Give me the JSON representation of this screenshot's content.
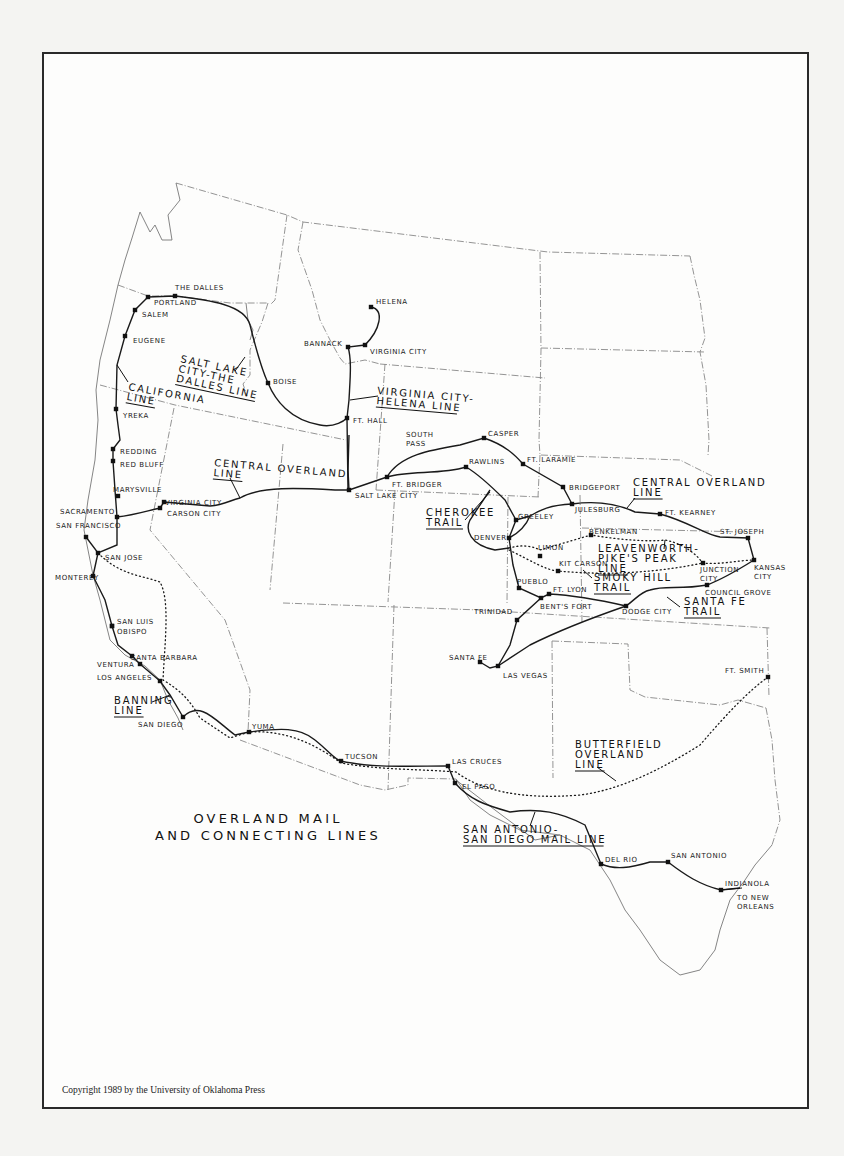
{
  "map": {
    "title_line1": "OVERLAND MAIL",
    "title_line2": "AND CONNECTING LINES",
    "copyright": "Copyright 1989 by the University of Oklahoma Press",
    "colors": {
      "ink": "#1a1a1a",
      "paper": "#fdfdfc",
      "border": "#888888"
    }
  },
  "towns": [
    {
      "name": "THE DALLES",
      "x": 175,
      "y": 296,
      "lx": 175,
      "ly": 290
    },
    {
      "name": "PORTLAND",
      "x": 148,
      "y": 297,
      "lx": 154,
      "ly": 305
    },
    {
      "name": "SALEM",
      "x": 135,
      "y": 310,
      "lx": 142,
      "ly": 317
    },
    {
      "name": "EUGENE",
      "x": 125,
      "y": 336,
      "lx": 133,
      "ly": 343
    },
    {
      "name": "HELENA",
      "x": 371,
      "y": 307,
      "lx": 376,
      "ly": 304
    },
    {
      "name": "BANNACK",
      "x": 348,
      "y": 347,
      "lx": 304,
      "ly": 346
    },
    {
      "name": "VIRGINIA CITY",
      "x": 365,
      "y": 345,
      "lx": 370,
      "ly": 354
    },
    {
      "name": "BOISE",
      "x": 268,
      "y": 383,
      "lx": 273,
      "ly": 384
    },
    {
      "name": "FT. HALL",
      "x": 347,
      "y": 418,
      "lx": 353,
      "ly": 423
    },
    {
      "name": "YREKA",
      "x": 116,
      "y": 409,
      "lx": 123,
      "ly": 418
    },
    {
      "name": "REDDING",
      "x": 113,
      "y": 449,
      "lx": 120,
      "ly": 454
    },
    {
      "name": "RED BLUFF",
      "x": 113,
      "y": 461,
      "lx": 120,
      "ly": 467
    },
    {
      "name": "MARYSVILLE",
      "x": 118,
      "y": 496,
      "lx": 113,
      "ly": 492
    },
    {
      "name": "VIRGINIA CITY",
      "x": 164,
      "y": 502,
      "lx": 165,
      "ly": 505
    },
    {
      "name": "CARSON CITY",
      "x": 160,
      "y": 508,
      "lx": 167,
      "ly": 516
    },
    {
      "name": "SACRAMENTO",
      "x": 117,
      "y": 517,
      "lx": 60,
      "ly": 514
    },
    {
      "name": "SAN FRANCISCO",
      "x": 86,
      "y": 537,
      "lx": 56,
      "ly": 528
    },
    {
      "name": "SAN JOSE",
      "x": 98,
      "y": 553,
      "lx": 105,
      "ly": 560
    },
    {
      "name": "MONTEREY",
      "x": 93,
      "y": 576,
      "lx": 55,
      "ly": 580
    },
    {
      "name": "SAN LUIS",
      "x": 112,
      "y": 626,
      "lx": 117,
      "ly": 624
    },
    {
      "name": "OBISPO",
      "x": 112,
      "y": 626,
      "lx": 117,
      "ly": 634
    },
    {
      "name": "SANTA BARBARA",
      "x": 132,
      "y": 656,
      "lx": 131,
      "ly": 660
    },
    {
      "name": "VENTURA",
      "x": 140,
      "y": 664,
      "lx": 97,
      "ly": 667
    },
    {
      "name": "LOS ANGELES",
      "x": 160,
      "y": 681,
      "lx": 97,
      "ly": 680
    },
    {
      "name": "SAN DIEGO",
      "x": 183,
      "y": 717,
      "lx": 138,
      "ly": 727
    },
    {
      "name": "YUMA",
      "x": 249,
      "y": 732,
      "lx": 252,
      "ly": 729
    },
    {
      "name": "TUCSON",
      "x": 341,
      "y": 761,
      "lx": 345,
      "ly": 759
    },
    {
      "name": "LAS CRUCES",
      "x": 448,
      "y": 766,
      "lx": 452,
      "ly": 764
    },
    {
      "name": "EL PASO",
      "x": 455,
      "y": 783,
      "lx": 462,
      "ly": 789
    },
    {
      "name": "CASPER",
      "x": 484,
      "y": 438,
      "lx": 488,
      "ly": 436
    },
    {
      "name": "SOUTH",
      "x": 0,
      "y": 0,
      "lx": 406,
      "ly": 437
    },
    {
      "name": "PASS",
      "x": 0,
      "y": 0,
      "lx": 406,
      "ly": 446
    },
    {
      "name": "FT. LARAMIE",
      "x": 523,
      "y": 464,
      "lx": 527,
      "ly": 462
    },
    {
      "name": "RAWLINS",
      "x": 466,
      "y": 467,
      "lx": 469,
      "ly": 464
    },
    {
      "name": "FT. BRIDGER",
      "x": 387,
      "y": 477,
      "lx": 392,
      "ly": 487
    },
    {
      "name": "SALT LAKE CITY",
      "x": 349,
      "y": 490,
      "lx": 355,
      "ly": 498
    },
    {
      "name": "BRIDGEPORT",
      "x": 563,
      "y": 487,
      "lx": 569,
      "ly": 490
    },
    {
      "name": "JULESBURG",
      "x": 572,
      "y": 504,
      "lx": 575,
      "ly": 512
    },
    {
      "name": "GREELEY",
      "x": 516,
      "y": 520,
      "lx": 518,
      "ly": 519
    },
    {
      "name": "DENVER",
      "x": 509,
      "y": 538,
      "lx": 474,
      "ly": 540
    },
    {
      "name": "LIMON",
      "x": 540,
      "y": 556,
      "lx": 538,
      "ly": 550
    },
    {
      "name": "BENKELMAN",
      "x": 591,
      "y": 535,
      "lx": 589,
      "ly": 534
    },
    {
      "name": "KIT CARSON",
      "x": 558,
      "y": 571,
      "lx": 559,
      "ly": 566
    },
    {
      "name": "FT. KEARNEY",
      "x": 660,
      "y": 514,
      "lx": 665,
      "ly": 515
    },
    {
      "name": "ST. JOSEPH",
      "x": 748,
      "y": 538,
      "lx": 720,
      "ly": 534
    },
    {
      "name": "KANSAS CITY",
      "x": 754,
      "y": 560,
      "lx": 754,
      "ly": 570
    },
    {
      "name": "KANSAS CITY 2",
      "x": 0,
      "y": 0,
      "lx": 754,
      "ly": 579
    },
    {
      "name": "JUNCTION",
      "x": 703,
      "y": 563,
      "lx": 700,
      "ly": 572
    },
    {
      "name": "JUNCTION 2",
      "x": 0,
      "y": 0,
      "lx": 700,
      "ly": 581
    },
    {
      "name": "COUNCIL GROVE",
      "x": 707,
      "y": 585,
      "lx": 705,
      "ly": 595
    },
    {
      "name": "PUEBLO",
      "x": 519,
      "y": 588,
      "lx": 517,
      "ly": 584
    },
    {
      "name": "FT. LYON",
      "x": 549,
      "y": 594,
      "lx": 553,
      "ly": 592
    },
    {
      "name": "BENT'S FORT",
      "x": 541,
      "y": 598,
      "lx": 540,
      "ly": 609
    },
    {
      "name": "DODGE CITY",
      "x": 626,
      "y": 606,
      "lx": 622,
      "ly": 614
    },
    {
      "name": "TRINIDAD",
      "x": 517,
      "y": 620,
      "lx": 474,
      "ly": 614
    },
    {
      "name": "SANTA FE",
      "x": 480,
      "y": 662,
      "lx": 449,
      "ly": 660
    },
    {
      "name": "LAS VEGAS",
      "x": 498,
      "y": 666,
      "lx": 503,
      "ly": 678
    },
    {
      "name": "FT. SMITH",
      "x": 768,
      "y": 677,
      "lx": 725,
      "ly": 673
    },
    {
      "name": "DEL RIO",
      "x": 601,
      "y": 864,
      "lx": 605,
      "ly": 862
    },
    {
      "name": "SAN ANTONIO",
      "x": 668,
      "y": 862,
      "lx": 671,
      "ly": 858
    },
    {
      "name": "INDIANOLA",
      "x": 721,
      "y": 890,
      "lx": 725,
      "ly": 886
    },
    {
      "name": "TO NEW",
      "x": 0,
      "y": 0,
      "lx": 737,
      "ly": 900
    },
    {
      "name": "ORLEANS",
      "x": 0,
      "y": 0,
      "lx": 737,
      "ly": 909
    }
  ],
  "route_labels": [
    {
      "id": "salt-lake-dalles",
      "lines": [
        "SALT LAKE",
        "CITY-THE",
        "DALLES LINE"
      ],
      "x": 180,
      "y": 362,
      "rotate": 12
    },
    {
      "id": "california",
      "lines": [
        "CALIFORNIA",
        "LINE"
      ],
      "x": 128,
      "y": 390,
      "rotate": 10
    },
    {
      "id": "virginia-helena",
      "lines": [
        "VIRGINIA CITY-",
        "HELENA LINE"
      ],
      "x": 377,
      "y": 394,
      "rotate": 5
    },
    {
      "id": "central-overland-west",
      "lines": [
        "CENTRAL OVERLAND",
        "LINE"
      ],
      "x": 214,
      "y": 466,
      "rotate": 5
    },
    {
      "id": "cherokee",
      "lines": [
        "CHEROKEE",
        "TRAIL"
      ],
      "x": 426,
      "y": 516,
      "rotate": 0
    },
    {
      "id": "central-overland-east",
      "lines": [
        "CENTRAL OVERLAND",
        "LINE"
      ],
      "x": 633,
      "y": 486,
      "rotate": 0
    },
    {
      "id": "leavenworth",
      "lines": [
        "LEAVENWORTH-",
        "PIKE'S PEAK",
        "LINE"
      ],
      "x": 598,
      "y": 552,
      "rotate": 0
    },
    {
      "id": "smoky-hill",
      "lines": [
        "SMOKY HILL",
        "TRAIL"
      ],
      "x": 594,
      "y": 581,
      "rotate": 0
    },
    {
      "id": "santa-fe",
      "lines": [
        "SANTA FE",
        "TRAIL"
      ],
      "x": 684,
      "y": 605,
      "rotate": 0
    },
    {
      "id": "banning",
      "lines": [
        "BANNING",
        "LINE"
      ],
      "x": 114,
      "y": 704,
      "rotate": 0
    },
    {
      "id": "butterfield",
      "lines": [
        "BUTTERFIELD",
        "OVERLAND",
        "LINE"
      ],
      "x": 575,
      "y": 748,
      "rotate": 0
    },
    {
      "id": "san-antonio-san-diego",
      "lines": [
        "SAN ANTONIO-",
        "SAN DIEGO MAIL LINE"
      ],
      "x": 463,
      "y": 833,
      "rotate": 0
    }
  ],
  "legend_icons": {
    "town_marker": "filled-square",
    "solid_route": "stage-line",
    "dotted_route": "alternate-line",
    "state_border": "dash-dot-line"
  }
}
